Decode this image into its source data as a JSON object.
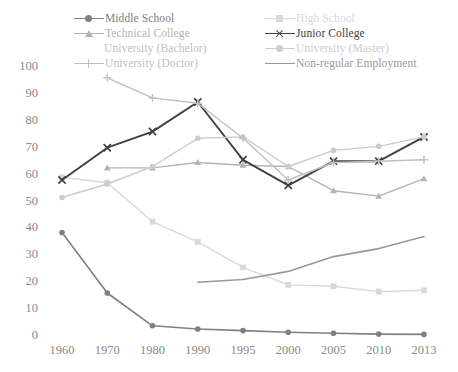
{
  "chart_data": {
    "type": "line",
    "title": "",
    "subtitle": "",
    "xlabel": "",
    "ylabel": "",
    "x": [
      "1960",
      "1970",
      "1980",
      "1990",
      "1995",
      "2000",
      "2005",
      "2010",
      "2013"
    ],
    "categories": [
      "1960",
      "1970",
      "1980",
      "1990",
      "1995",
      "2000",
      "2005",
      "2010",
      "2013"
    ],
    "ylim": [
      0,
      100
    ],
    "yticks": [
      0,
      10,
      20,
      30,
      40,
      50,
      60,
      70,
      80,
      90,
      100
    ],
    "grid": false,
    "legend_position": "top",
    "series": [
      {
        "name": "Middle School",
        "color": "#808080",
        "marker": "dot",
        "line_width": 1.6,
        "values": [
          38.5,
          16.0,
          3.8,
          2.6,
          2.0,
          1.4,
          1.0,
          0.7,
          0.6
        ]
      },
      {
        "name": "High School",
        "color": "#d9d9d9",
        "marker": "square",
        "line_width": 1.4,
        "values": [
          59.0,
          57.0,
          42.5,
          35.0,
          25.5,
          19.0,
          18.5,
          16.5,
          17.0
        ]
      },
      {
        "name": "Technical College",
        "color": "#b3b3b3",
        "marker": "triangle",
        "line_width": 1.4,
        "values": [
          null,
          62.5,
          62.5,
          64.5,
          63.5,
          63.0,
          54.0,
          52.0,
          58.5
        ]
      },
      {
        "name": "Junior College",
        "color": "#404040",
        "marker": "cross",
        "line_width": 1.9,
        "values": [
          58.0,
          70.0,
          76.0,
          87.0,
          65.5,
          56.0,
          65.0,
          65.0,
          74.0
        ]
      },
      {
        "name": "University (Bachelor)",
        "color": "#c0c0c0",
        "marker": "none",
        "line_width": 1.4,
        "values": [
          null,
          null,
          null,
          null,
          null,
          null,
          null,
          null,
          null
        ]
      },
      {
        "name": "University (Master)",
        "color": "#cccccc",
        "marker": "dot",
        "line_width": 1.4,
        "values": [
          51.5,
          56.5,
          63.0,
          73.5,
          74.0,
          63.0,
          69.0,
          70.5,
          74.0
        ]
      },
      {
        "name": "University (Doctor)",
        "color": "#bfbfbf",
        "marker": "plus",
        "line_width": 1.4,
        "values": [
          null,
          96.0,
          88.5,
          86.5,
          73.5,
          58.0,
          64.5,
          65.0,
          65.5
        ]
      },
      {
        "name": "Non-regular Employment",
        "color": "#999999",
        "marker": "none",
        "line_width": 1.6,
        "values": [
          null,
          null,
          null,
          20.0,
          21.0,
          24.0,
          29.5,
          32.5,
          37.0
        ]
      }
    ]
  },
  "legend": {
    "left_column": [
      {
        "label": "Middle School",
        "color": "#808080",
        "marker": "dot",
        "line": true,
        "indent": false
      },
      {
        "label": "Technical College",
        "color": "#b3b3b3",
        "marker": "triangle",
        "line": true,
        "indent": false
      },
      {
        "label": "University (Bachelor)",
        "color": "#c0c0c0",
        "marker": "none",
        "line": false,
        "indent": true
      },
      {
        "label": "University (Doctor)",
        "color": "#bfbfbf",
        "marker": "plus",
        "line": true,
        "indent": false
      }
    ],
    "right_column": [
      {
        "label": "High School",
        "color": "#d9d9d9",
        "marker": "square",
        "line": true,
        "indent": false
      },
      {
        "label": "Junior College",
        "color": "#404040",
        "marker": "cross",
        "line": true,
        "indent": false
      },
      {
        "label": "University (Master)",
        "color": "#cccccc",
        "marker": "dot",
        "line": true,
        "indent": false
      },
      {
        "label": "Non-regular Employment",
        "color": "#999999",
        "marker": "none",
        "line": true,
        "indent": false
      }
    ]
  },
  "axes": {
    "y_labels": [
      "100",
      "90",
      "80",
      "70",
      "60",
      "50",
      "40",
      "30",
      "20",
      "10",
      "0"
    ],
    "x_labels": [
      "1960",
      "1970",
      "1980",
      "1990",
      "1995",
      "2000",
      "2005",
      "2010",
      "2013"
    ]
  }
}
